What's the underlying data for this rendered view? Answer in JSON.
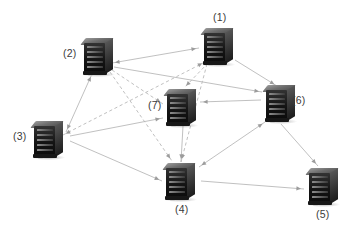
{
  "diagram": {
    "type": "node-link-graph",
    "background_color": "#ffffff",
    "edge_color": "#b9b9b9",
    "label_color": "#3b3b3b",
    "node_icon": "server-rack-icon",
    "width": 354,
    "height": 229
  },
  "nodes": [
    {
      "id": "1",
      "label": "(1)",
      "icon": "server-rack-icon",
      "x": 201,
      "y": 28,
      "label_x": 213,
      "label_y": 12
    },
    {
      "id": "2",
      "label": "(2)",
      "icon": "server-rack-icon",
      "x": 81,
      "y": 38,
      "label_x": 63,
      "label_y": 48
    },
    {
      "id": "3",
      "label": "(3)",
      "icon": "server-rack-icon",
      "x": 31,
      "y": 121,
      "label_x": 13,
      "label_y": 131
    },
    {
      "id": "4",
      "label": "(4)",
      "icon": "server-rack-icon",
      "x": 163,
      "y": 163,
      "label_x": 175,
      "label_y": 204
    },
    {
      "id": "5",
      "label": "(5)",
      "icon": "server-rack-icon",
      "x": 306,
      "y": 168,
      "label_x": 316,
      "label_y": 209
    },
    {
      "id": "6",
      "label": "(6)",
      "icon": "server-rack-icon",
      "x": 263,
      "y": 85,
      "label_x": 292,
      "label_y": 95
    },
    {
      "id": "7",
      "label": "(7)",
      "icon": "server-rack-icon",
      "x": 164,
      "y": 89,
      "label_x": 148,
      "label_y": 100
    }
  ],
  "edges": [
    {
      "from": "2",
      "to": "1",
      "style": "solid",
      "arrow": "both",
      "x1": 112,
      "y1": 63,
      "x2": 199,
      "y2": 48
    },
    {
      "from": "1",
      "to": "6",
      "style": "solid",
      "arrow": "forward",
      "x1": 235,
      "y1": 60,
      "x2": 277,
      "y2": 86
    },
    {
      "from": "1",
      "to": "3",
      "style": "dashed",
      "arrow": "both",
      "x1": 205,
      "y1": 62,
      "x2": 63,
      "y2": 135
    },
    {
      "from": "1",
      "to": "7",
      "style": "dashed",
      "arrow": "forward",
      "x1": 208,
      "y1": 63,
      "x2": 184,
      "y2": 88
    },
    {
      "from": "1",
      "to": "4",
      "style": "dashed",
      "arrow": "forward",
      "x1": 207,
      "y1": 64,
      "x2": 181,
      "y2": 162
    },
    {
      "from": "2",
      "to": "3",
      "style": "solid",
      "arrow": "both",
      "x1": 92,
      "y1": 74,
      "x2": 66,
      "y2": 132
    },
    {
      "from": "2",
      "to": "6",
      "style": "solid",
      "arrow": "forward",
      "x1": 114,
      "y1": 67,
      "x2": 262,
      "y2": 92
    },
    {
      "from": "2",
      "to": "7",
      "style": "dashed",
      "arrow": "forward",
      "x1": 112,
      "y1": 70,
      "x2": 163,
      "y2": 104
    },
    {
      "from": "2",
      "to": "4",
      "style": "dashed",
      "arrow": "forward",
      "x1": 110,
      "y1": 72,
      "x2": 172,
      "y2": 161
    },
    {
      "from": "3",
      "to": "7",
      "style": "solid",
      "arrow": "forward",
      "x1": 70,
      "y1": 136,
      "x2": 163,
      "y2": 118
    },
    {
      "from": "3",
      "to": "4",
      "style": "solid",
      "arrow": "forward",
      "x1": 70,
      "y1": 141,
      "x2": 162,
      "y2": 181
    },
    {
      "from": "6",
      "to": "7",
      "style": "solid",
      "arrow": "forward",
      "x1": 261,
      "y1": 100,
      "x2": 200,
      "y2": 102
    },
    {
      "from": "6",
      "to": "4",
      "style": "solid",
      "arrow": "both",
      "x1": 265,
      "y1": 122,
      "x2": 199,
      "y2": 167
    },
    {
      "from": "6",
      "to": "5",
      "style": "solid",
      "arrow": "forward",
      "x1": 281,
      "y1": 124,
      "x2": 318,
      "y2": 166
    },
    {
      "from": "7",
      "to": "4",
      "style": "solid",
      "arrow": "forward",
      "x1": 183,
      "y1": 126,
      "x2": 181,
      "y2": 162
    },
    {
      "from": "4",
      "to": "5",
      "style": "solid",
      "arrow": "forward",
      "x1": 201,
      "y1": 181,
      "x2": 304,
      "y2": 189
    }
  ]
}
